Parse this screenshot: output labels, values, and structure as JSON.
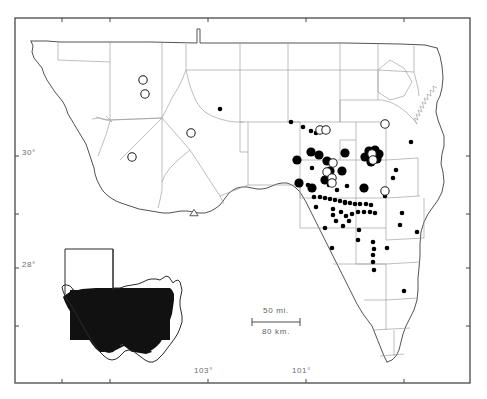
{
  "figure": {
    "type": "distribution-map",
    "region": "West Texas (Trans-Pecos and Edwards Plateau)",
    "frame": {
      "x": 15,
      "y": 18,
      "width": 455,
      "height": 365
    },
    "background_color": "#ffffff",
    "outline_color": "#4a4a4a",
    "county_line_color": "#8c8c8c",
    "symbol_fill_color": "#000000",
    "label_color": "#6d6d6d"
  },
  "axes": {
    "latitude_labels": [
      {
        "text": "30°",
        "x": 22,
        "y": 152,
        "tick_y": 156
      },
      {
        "text": "28°",
        "x": 22,
        "y": 264,
        "tick_y": 268
      }
    ],
    "longitude_labels": [
      {
        "text": "103°",
        "x": 196,
        "y": 372,
        "tick_x": 208
      },
      {
        "text": "101°",
        "x": 294,
        "y": 372,
        "tick_x": 306
      }
    ],
    "left_ticks": [
      156,
      214,
      268,
      326
    ],
    "top_ticks": [
      62,
      110,
      208,
      306,
      404
    ],
    "bottom_ticks": [
      62,
      110,
      208,
      306,
      404
    ],
    "right_ticks": [
      156,
      214,
      268,
      326
    ]
  },
  "scale_bar": {
    "miles_label": "50 mi.",
    "km_label": "80 km.",
    "x": 252,
    "y": 309,
    "bar_width": 48,
    "bar_y": 322
  },
  "inset": {
    "name": "texas-state-inset",
    "description": "Outline of Texas with study area shaded black",
    "x": 60,
    "y": 240,
    "width": 120,
    "height": 120
  },
  "legend_symbols": [
    {
      "symbol": "filled-circle-small",
      "meaning": "locality record (small)"
    },
    {
      "symbol": "filled-circle-large",
      "meaning": "locality record (large)"
    },
    {
      "symbol": "open-circle",
      "meaning": "literature / unverified record"
    },
    {
      "symbol": "open-triangle",
      "meaning": "type locality"
    }
  ],
  "chart_data": {
    "type": "scatter",
    "title": "",
    "xlabel": "Longitude",
    "ylabel": "Latitude",
    "series": [
      {
        "name": "filled-small",
        "symbol": "filled-circle",
        "radius": 2.3,
        "points": [
          [
            220,
            109
          ],
          [
            291,
            122
          ],
          [
            303,
            127
          ],
          [
            311,
            131
          ],
          [
            316,
            133
          ],
          [
            411,
            142
          ],
          [
            312,
            168
          ],
          [
            308,
            185
          ],
          [
            314,
            197
          ],
          [
            320,
            197
          ],
          [
            325,
            198
          ],
          [
            330,
            199
          ],
          [
            335,
            200
          ],
          [
            340,
            201
          ],
          [
            345,
            202
          ],
          [
            350,
            203
          ],
          [
            355,
            204
          ],
          [
            360,
            204
          ],
          [
            366,
            204
          ],
          [
            371,
            205
          ],
          [
            316,
            207
          ],
          [
            333,
            209
          ],
          [
            337,
            190
          ],
          [
            347,
            186
          ],
          [
            364,
            190
          ],
          [
            385,
            196
          ],
          [
            393,
            178
          ],
          [
            396,
            170
          ],
          [
            333,
            215
          ],
          [
            341,
            212
          ],
          [
            346,
            216
          ],
          [
            352,
            214
          ],
          [
            358,
            212
          ],
          [
            364,
            212
          ],
          [
            370,
            212
          ],
          [
            375,
            213
          ],
          [
            349,
            221
          ],
          [
            336,
            221
          ],
          [
            343,
            226
          ],
          [
            325,
            228
          ],
          [
            359,
            230
          ],
          [
            402,
            213
          ],
          [
            400,
            225
          ],
          [
            358,
            240
          ],
          [
            373,
            242
          ],
          [
            374,
            249
          ],
          [
            373,
            255
          ],
          [
            373,
            262
          ],
          [
            374,
            270
          ],
          [
            417,
            232
          ],
          [
            345,
            203
          ],
          [
            387,
            248
          ],
          [
            404,
            291
          ],
          [
            332,
            248
          ],
          [
            329,
            185
          ]
        ]
      },
      {
        "name": "filled-large",
        "symbol": "filled-circle",
        "radius": 4.6,
        "points": [
          [
            311,
            152
          ],
          [
            297,
            160
          ],
          [
            345,
            153
          ],
          [
            327,
            161
          ],
          [
            330,
            171
          ],
          [
            342,
            171
          ],
          [
            325,
            180
          ],
          [
            299,
            183
          ],
          [
            319,
            155
          ],
          [
            369,
            151
          ],
          [
            375,
            150
          ],
          [
            379,
            154
          ],
          [
            371,
            157
          ],
          [
            377,
            159
          ],
          [
            365,
            157
          ],
          [
            371,
            162
          ],
          [
            312,
            188
          ],
          [
            364,
            188
          ]
        ]
      },
      {
        "name": "open-circle",
        "symbol": "open-circle",
        "radius": 4.2,
        "points": [
          [
            143,
            80
          ],
          [
            145,
            94
          ],
          [
            191,
            133
          ],
          [
            132,
            157
          ],
          [
            320,
            130
          ],
          [
            326,
            130
          ],
          [
            385,
            124
          ],
          [
            333,
            163
          ],
          [
            327,
            172
          ],
          [
            332,
            178
          ],
          [
            332,
            183
          ],
          [
            372,
            154
          ],
          [
            373,
            160
          ],
          [
            385,
            191
          ]
        ]
      },
      {
        "name": "open-triangle",
        "symbol": "open-triangle",
        "radius": 3.6,
        "points": [
          [
            194,
            213
          ]
        ]
      }
    ]
  }
}
